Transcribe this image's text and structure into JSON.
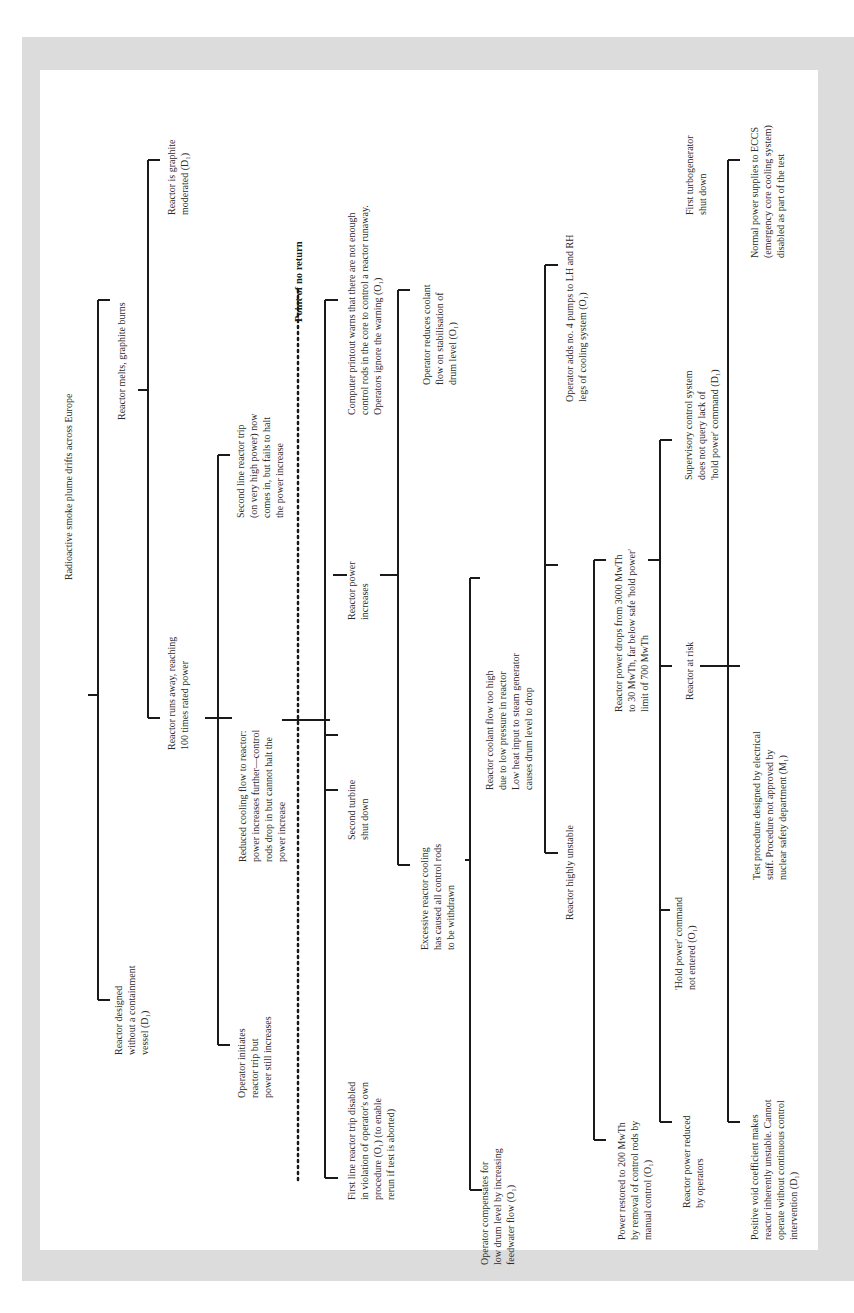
{
  "diagram": {
    "type": "fault-tree",
    "orientation": "rotated-90-ccw",
    "colors": {
      "frame": "#dcdcdc",
      "panel": "#ffffff",
      "line": "#1a1a1a",
      "text": "#2b2b2b"
    },
    "top_event": "Radioactive smoke plume drifts across Europe",
    "nodes": {
      "n1": "Reactor designed\nwithout a containment\nvessel (D₁)",
      "n2": "Reactor runs away, reaching\n100 times rated power",
      "n3": "Reactor melts, graphite burns",
      "n4": "Reactor is graphite\nmoderated (D₁)",
      "n5": "Operator initiates\nreactor trip but\npower still increases",
      "n6": "Reduced cooling flow to reactor:\npower increases further—control\nrods drop in but cannot halt the\npower increase",
      "n7": "Second line reactor trip\n(on very high power) now\ncomes in, but fails to halt\nthe power increase",
      "point_of_no_return": "Point of no return",
      "n8": "First line reactor trip disabled\nin violation of operator's own\nprocedure (O₁) (to enable\nrerun if test is aborted)",
      "n9": "Second turbine\nshut down",
      "n10": "Reactor power\nincreases",
      "n11": "Computer printout warns that there are not enough\ncontrol rods in the core to control a reactor runaway.\nOperators ignore the warning (O₁)",
      "n12": "Excessive reactor cooling\nhas caused all control rods\nto be withdrawn",
      "n13": "Reactor coolant flow too high\ndue to low pressure in reactor\nLow heat input to steam generator\ncauses drum level to drop",
      "n14": "Operator reduces coolant\nflow on stabilisation of\ndrum level (O₁)",
      "n15": "Operator compensates for\nlow drum level by increasing\nfeedwater flow (O₁)",
      "n16": "Reactor highly unstable",
      "n17": "Operator adds no. 4 pumps to LH and RH\nlegs of cooling system (O₁)",
      "n18": "Power restored to 200 MwTh\nby removal of control rods by\nmanual control (O₁)",
      "n19": "'Hold power' command\nnot entered (O₁)",
      "n20": "Reactor power drops from 3000 MwTh\nto 30 MwTh, far below safe 'hold power'\nlimit of 700 MwTh",
      "n21": "Reactor power reduced\nby operators",
      "n22": "Reactor at risk",
      "n23": "Supervisory control system\ndoes not query lack of\n'hold power' command (D₁)",
      "n24": "First turbogenerator\nshut down",
      "n25": "Positive void coefficient makes\nreactor inherently unstable. Cannot\noperate without continuous control\nintervention (D₁)",
      "n26": "Test procedure designed by electrical\nstaff. Procedure not approved by\nnuclear safety department (M₁)",
      "n27": "Normal power supplies to ECCS\n(emergency core cooling system)\ndisabled as part of the test"
    }
  }
}
